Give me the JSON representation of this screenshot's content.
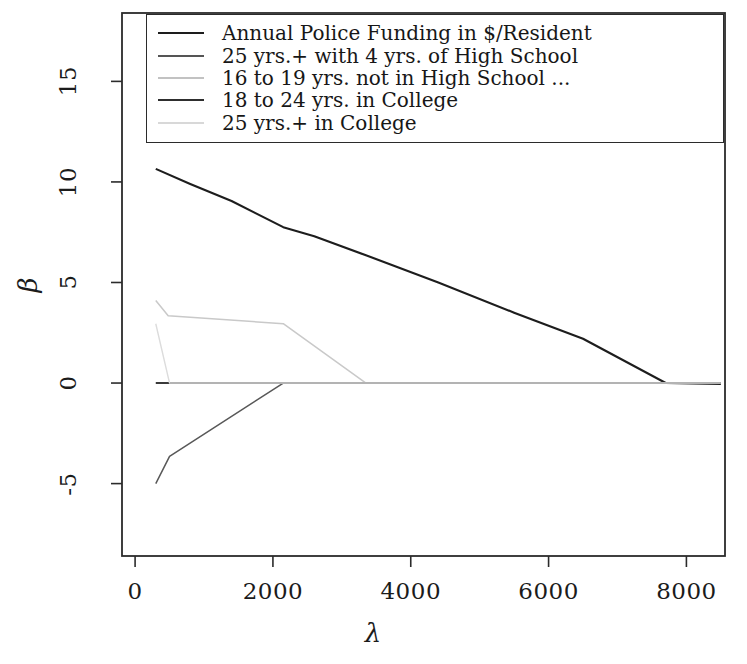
{
  "chart_data": {
    "type": "line",
    "title": "",
    "xlabel": "λ",
    "ylabel": "β",
    "xlim": [
      -190,
      8560
    ],
    "ylim": [
      -8.6,
      18.4
    ],
    "xticks": [
      0,
      2000,
      4000,
      6000,
      8000
    ],
    "xticklabels": [
      "0",
      "2000",
      "4000",
      "6000",
      "8000"
    ],
    "yticks": [
      -5,
      0,
      5,
      10,
      15
    ],
    "yticklabels": [
      "-5",
      "0",
      "5",
      "10",
      "15"
    ],
    "grid": false,
    "legend_position": "top",
    "series": [
      {
        "name": "Annual Police Funding in $/Resident",
        "color": "#1d1d1d",
        "width": 2.1,
        "x": [
          300,
          800,
          1400,
          2150,
          2600,
          3350,
          4400,
          5500,
          6500,
          7700,
          8500
        ],
        "y": [
          10.65,
          9.9,
          9.05,
          7.75,
          7.3,
          6.35,
          5.0,
          3.5,
          2.2,
          0.0,
          -0.05
        ]
      },
      {
        "name": "25 yrs.+ with 4 yrs. of High School",
        "color": "#585858",
        "width": 1.5,
        "x": [
          300,
          500,
          2150,
          2600,
          3350,
          8500
        ],
        "y": [
          -5.0,
          -3.65,
          0.0,
          0.0,
          0.0,
          0.0
        ]
      },
      {
        "name": "16 to 19 yrs. not in High School ...",
        "color": "#c9c9c9",
        "width": 1.5,
        "x": [
          300,
          480,
          2150,
          3350,
          8500
        ],
        "y": [
          4.1,
          3.35,
          2.95,
          0.0,
          0.0
        ]
      },
      {
        "name": "18 to 24 yrs. in College",
        "color": "#3a3a3a",
        "width": 1.9,
        "x": [
          300,
          500,
          8500
        ],
        "y": [
          0.0,
          0.0,
          0.0
        ]
      },
      {
        "name": "25 yrs.+ in College",
        "color": "#dcdcdc",
        "width": 1.4,
        "x": [
          300,
          500,
          8500
        ],
        "y": [
          2.95,
          0.0,
          0.0
        ]
      }
    ]
  },
  "legend": {
    "items": [
      {
        "label": "Annual Police Funding in $/Resident",
        "color": "#1d1d1d",
        "width": "2.4px"
      },
      {
        "label": "25 yrs.+ with 4 yrs. of High School",
        "color": "#555555",
        "width": "2.2px"
      },
      {
        "label": "16 to 19 yrs. not in High School ...",
        "color": "#c2c2c2",
        "width": "2.0px"
      },
      {
        "label": "18 to 24 yrs. in College",
        "color": "#2e2e2e",
        "width": "2.4px"
      },
      {
        "label": "25 yrs.+ in College",
        "color": "#d8d8d8",
        "width": "2.0px"
      }
    ]
  },
  "axes": {
    "x_title": "λ",
    "y_title": "β",
    "xtick_labels": [
      "0",
      "2000",
      "4000",
      "6000",
      "8000"
    ],
    "ytick_labels": [
      "-5",
      "0",
      "5",
      "10",
      "15"
    ]
  },
  "frame": {
    "color": "#2b2b2b",
    "left_px": 122,
    "right_px": 725,
    "top_px": 13,
    "bottom_px": 556
  }
}
